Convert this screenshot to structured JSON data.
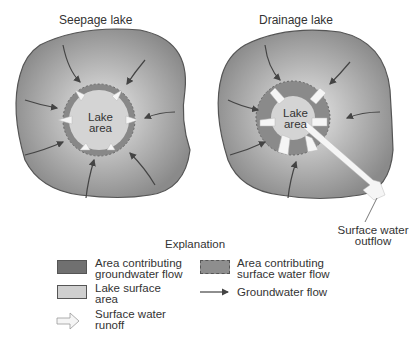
{
  "diagram": {
    "left": {
      "title": "Seepage lake",
      "lake_label_1": "Lake",
      "lake_label_2": "area"
    },
    "right": {
      "title": "Drainage lake",
      "lake_label_1": "Lake",
      "lake_label_2": "area",
      "outflow_label_1": "Surface water",
      "outflow_label_2": "outflow"
    }
  },
  "legend": {
    "title": "Explanation",
    "items": [
      {
        "label_1": "Area contributing",
        "label_2": "groundwater flow",
        "symbol": "dark-gray-swatch",
        "color": "#707070"
      },
      {
        "label_1": "Area contributing",
        "label_2": "surface water flow",
        "symbol": "medium-gray-swatch",
        "color": "#8e8e8e"
      },
      {
        "label_1": "Lake surface",
        "label_2": "area",
        "symbol": "light-gray-swatch",
        "color": "#cfcfcf"
      },
      {
        "label_1": "Groundwater flow",
        "label_2": "",
        "symbol": "arrow-icon"
      },
      {
        "label_1": "Surface water",
        "label_2": "runoff",
        "symbol": "hollow-arrow-icon"
      }
    ]
  },
  "colors": {
    "outer": "#9a9a9a",
    "inner": "#e0e0e0",
    "border": "#555555",
    "lake": "#cccccc",
    "ring": "#8a8a8a"
  }
}
